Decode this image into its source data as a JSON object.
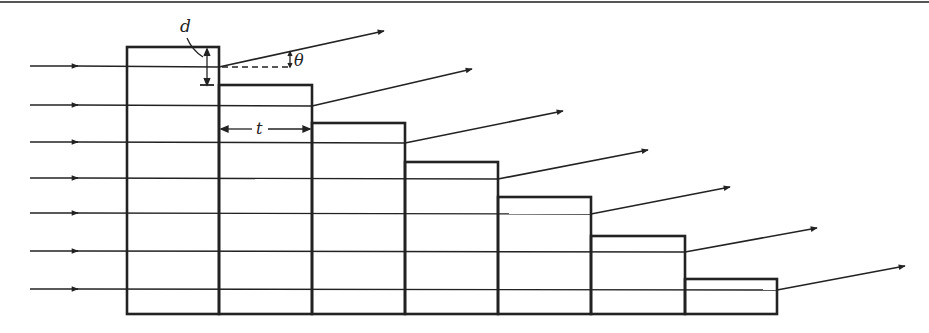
{
  "diagram": {
    "type": "echelon-grating",
    "colors": {
      "ink": "#222222",
      "background": "#ffffff"
    },
    "labels": {
      "step_height": "d",
      "step_width": "t",
      "deflection_angle": "θ"
    },
    "steps": [
      {
        "x0": 127,
        "x1": 219,
        "top": 47
      },
      {
        "x0": 219,
        "x1": 312,
        "top": 85
      },
      {
        "x0": 312,
        "x1": 405,
        "top": 123
      },
      {
        "x0": 405,
        "x1": 498,
        "top": 162
      },
      {
        "x0": 498,
        "x1": 591,
        "top": 197
      },
      {
        "x0": 591,
        "x1": 685,
        "top": 236
      },
      {
        "x0": 685,
        "x1": 777,
        "top": 279
      }
    ],
    "base_y": 314,
    "rays": [
      {
        "y": 66,
        "exit_x": 219,
        "end": [
          384,
          31
        ]
      },
      {
        "y": 105,
        "exit_x": 312,
        "end": [
          472,
          69
        ]
      },
      {
        "y": 142,
        "exit_x": 405,
        "end": [
          563,
          111
        ]
      },
      {
        "y": 178,
        "exit_x": 498,
        "end": [
          648,
          150
        ]
      },
      {
        "y": 213,
        "exit_x": 591,
        "end": [
          730,
          187
        ]
      },
      {
        "y": 251,
        "exit_x": 685,
        "end": [
          817,
          228
        ]
      },
      {
        "y": 289,
        "exit_x": 777,
        "end": [
          905,
          266
        ]
      }
    ]
  }
}
